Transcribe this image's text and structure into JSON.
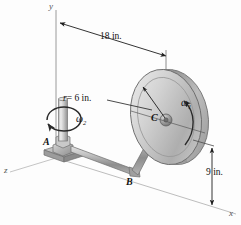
{
  "figure": {
    "background_color": "#fdfdfd",
    "line_color": "#3a3a3a",
    "axes": {
      "y_label": "y",
      "x_label": "x",
      "z_label": "z"
    },
    "dimensions": [
      {
        "id": "horizontal-offset",
        "label": "18 in.",
        "value": 18,
        "unit": "in."
      },
      {
        "id": "disk-radius",
        "label": "r = 6 in.",
        "symbol": "r",
        "equals": "= 6 in.",
        "value": 6,
        "unit": "in."
      },
      {
        "id": "height-above-x-axis",
        "label": "9 in.",
        "value": 9,
        "unit": "in."
      }
    ],
    "points": [
      {
        "id": "point-a",
        "label": "A"
      },
      {
        "id": "point-b",
        "label": "B"
      },
      {
        "id": "point-c",
        "label": "C"
      }
    ],
    "angular_velocities": [
      {
        "id": "omega-1",
        "symbol": "ω",
        "subscript": "1",
        "location": "disk-spin"
      },
      {
        "id": "omega-2",
        "symbol": "ω",
        "subscript": "2",
        "location": "vertical-shaft"
      }
    ],
    "colors": {
      "metal_light": "#e8e8e8",
      "metal_mid": "#b9b9b9",
      "metal_dark": "#8a8a8a",
      "outline": "#5a5a5a",
      "dimension": "#222222"
    }
  }
}
